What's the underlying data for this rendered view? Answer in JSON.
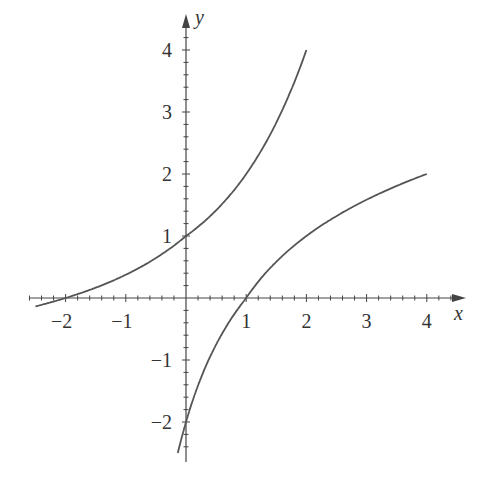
{
  "chart_data": {
    "type": "line",
    "title": "",
    "xlabel": "x",
    "ylabel": "y",
    "xlim": [
      -2.5,
      4.5
    ],
    "ylim": [
      -2.5,
      4.5
    ],
    "grid": false,
    "x_ticks": [
      -2,
      -1,
      1,
      2,
      3,
      4
    ],
    "y_ticks": [
      -2,
      -1,
      1,
      2,
      3,
      4
    ],
    "x_tick_labels": [
      "−2",
      "−1",
      "1",
      "2",
      "3",
      "4"
    ],
    "y_tick_labels": [
      "−2",
      "−1",
      "1",
      "2",
      "3",
      "4"
    ],
    "series": [
      {
        "name": "f(x)",
        "x": [
          -2.4,
          -2,
          -1,
          0,
          1,
          2
        ],
        "values": [
          -0.2,
          0,
          0.45,
          1,
          2,
          4
        ]
      },
      {
        "name": "inverse f(x)",
        "x": [
          -0.2,
          0,
          0.45,
          1,
          2,
          4
        ],
        "values": [
          -2.4,
          -2,
          -1,
          0,
          1,
          2
        ]
      }
    ],
    "line_color": "#555555"
  }
}
